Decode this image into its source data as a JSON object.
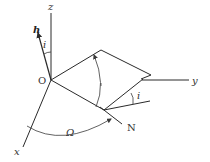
{
  "diagram": {
    "colors": {
      "line": "#2a2a2a",
      "text": "#333333",
      "background": "#ffffff"
    },
    "labels": {
      "z_axis": "z",
      "x_axis": "x",
      "y_axis": "y",
      "origin": "O",
      "angular_momentum": "h",
      "inclination_top": "i",
      "inclination_node": "i",
      "node": "N",
      "raan": "Ω"
    },
    "elements": [
      {
        "id": "z-axis",
        "type": "line",
        "label": "z"
      },
      {
        "id": "x-axis",
        "type": "line",
        "label": "x"
      },
      {
        "id": "y-axis",
        "type": "line",
        "label": "y"
      },
      {
        "id": "h-vector",
        "type": "arrow",
        "label": "h"
      },
      {
        "id": "orbit-plane",
        "type": "parallelogram"
      },
      {
        "id": "node-line",
        "type": "line",
        "label": "N"
      },
      {
        "id": "inclination-angle-top",
        "type": "arc",
        "label": "i"
      },
      {
        "id": "inclination-angle-node",
        "type": "arc",
        "label": "i"
      },
      {
        "id": "raan-angle",
        "type": "arc-arrow",
        "label": "Ω"
      },
      {
        "id": "plane-rotation",
        "type": "arc-arrow"
      }
    ]
  }
}
